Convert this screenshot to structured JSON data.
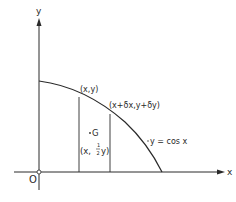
{
  "diagram": {
    "axes": {
      "x_label": "x",
      "y_label": "y",
      "origin_label": "O"
    },
    "curve": {
      "equation_label": "y = cos x"
    },
    "points": {
      "p1": "(x,y)",
      "p2": "(x+δx,y+δy)",
      "centroid_label": "G",
      "centroid_coord_prefix": "(x,",
      "centroid_frac_num": "1",
      "centroid_frac_den": "2",
      "centroid_coord_suffix": "y)"
    },
    "colors": {
      "line": "#2a2a2a",
      "background": "#ffffff"
    }
  }
}
